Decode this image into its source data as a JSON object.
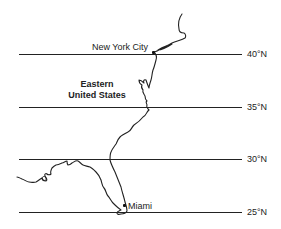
{
  "map": {
    "region_label_line1": "Eastern",
    "region_label_line2": "United States",
    "latitudes": [
      {
        "label": "40°N",
        "value": 40
      },
      {
        "label": "35°N",
        "value": 35
      },
      {
        "label": "30°N",
        "value": 30
      },
      {
        "label": "25°N",
        "value": 25
      }
    ],
    "cities": [
      {
        "name": "New York City"
      },
      {
        "name": "Miami"
      }
    ],
    "colors": {
      "line": "#222222",
      "background": "#ffffff"
    }
  }
}
